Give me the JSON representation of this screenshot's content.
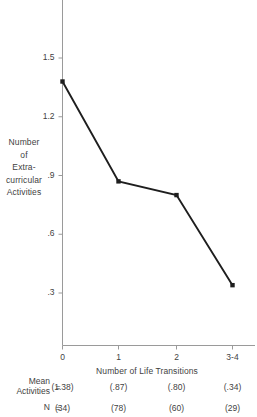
{
  "chart_data": {
    "type": "line",
    "title": "",
    "xlabel": "Number of Life Transitions",
    "ylabel_lines": [
      "Number",
      "of",
      "Extra-",
      "curricular",
      "Activities"
    ],
    "categories": [
      "0",
      "1",
      "2",
      "3-4"
    ],
    "values": [
      1.38,
      0.87,
      0.8,
      0.34
    ],
    "ytick_labels": [
      "1.5",
      "1.2",
      ".9",
      ".6",
      ".3"
    ],
    "ytick_values": [
      1.5,
      1.2,
      0.9,
      0.6,
      0.3
    ],
    "ylim": [
      0.0,
      1.62
    ],
    "xlim": [
      -0.25,
      3.35
    ],
    "grid": false,
    "legend": "none",
    "marker": "square",
    "line_color": "#1e1e1e",
    "axis_color": "#9a9a9a",
    "series": [
      {
        "name": "Mean Extracurricular Activities",
        "values": [
          1.38,
          0.87,
          0.8,
          0.34
        ]
      }
    ]
  },
  "table": {
    "rows": [
      {
        "label_lines": [
          "Mean",
          "Activities"
        ],
        "equals": "=",
        "cells": [
          "(1.38)",
          "(.87)",
          "(.80)",
          "(.34)"
        ]
      },
      {
        "label_lines": [
          "N"
        ],
        "equals": "=",
        "cells": [
          "(34)",
          "(78)",
          "(60)",
          "(29)"
        ]
      }
    ]
  }
}
